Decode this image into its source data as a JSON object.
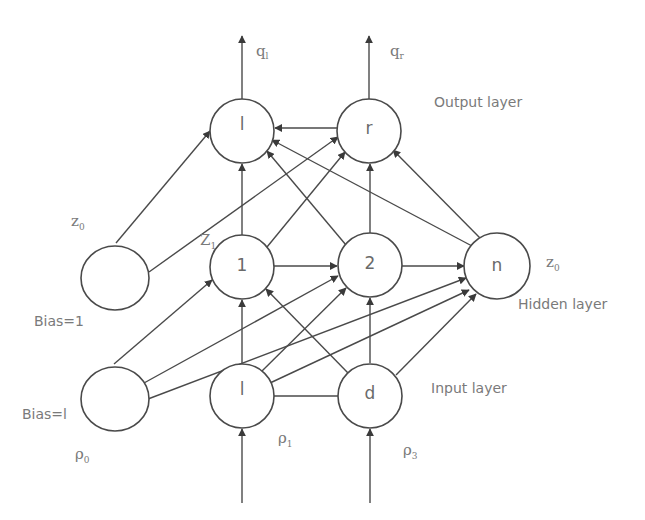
{
  "diagram": {
    "colors": {
      "stroke": "#4a4a4a",
      "text": "#7a7a7a",
      "background": "#ffffff"
    },
    "layers": {
      "output": {
        "label": "Output layer"
      },
      "hidden": {
        "label": "Hidden layer"
      },
      "input": {
        "label": "Input layer"
      }
    },
    "nodes": {
      "out_l": {
        "label": "l"
      },
      "out_r": {
        "label": "r"
      },
      "hid_bias": {
        "label": ""
      },
      "hid_1": {
        "label": "1"
      },
      "hid_2": {
        "label": "2"
      },
      "hid_n": {
        "label": "n"
      },
      "in_bias": {
        "label": ""
      },
      "in_l": {
        "label": "l"
      },
      "in_d": {
        "label": "d"
      }
    },
    "annotations": {
      "q_l": {
        "base": "q",
        "sub": "l"
      },
      "q_r": {
        "base": "q",
        "sub": "r"
      },
      "z0_left": {
        "base": "z",
        "sub": "0"
      },
      "z1": {
        "base": "Z",
        "sub": "1"
      },
      "z0_right": {
        "base": "z",
        "sub": "0"
      },
      "bias_hidden": "Bias=1",
      "bias_input": "Bias=l",
      "rho0": {
        "base": "ρ",
        "sub": "0"
      },
      "rho1": {
        "base": "ρ",
        "sub": "1"
      },
      "rho3": {
        "base": "ρ",
        "sub": "3"
      }
    }
  }
}
